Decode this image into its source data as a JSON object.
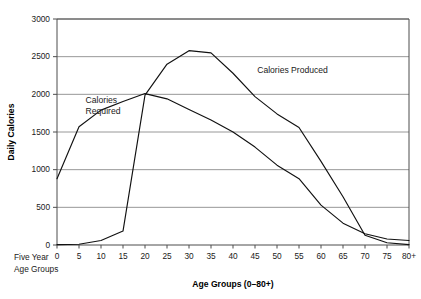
{
  "chart_data": {
    "type": "line",
    "title": "",
    "xlabel": "Age Groups (0–80+)",
    "ylabel": "Daily Calories",
    "x": [
      0,
      5,
      10,
      15,
      20,
      25,
      30,
      35,
      40,
      45,
      50,
      55,
      60,
      65,
      70,
      75,
      80
    ],
    "categories": [
      "0",
      "5",
      "10",
      "15",
      "20",
      "25",
      "30",
      "35",
      "40",
      "45",
      "50",
      "55",
      "60",
      "65",
      "70",
      "75",
      "80+"
    ],
    "xlim": [
      0,
      80
    ],
    "ylim": [
      0,
      3000
    ],
    "yticks": [
      0,
      500,
      1000,
      1500,
      2000,
      2500,
      3000
    ],
    "ytick_labels": [
      "0",
      "500",
      "1000",
      "1500",
      "2000",
      "2500",
      "3000"
    ],
    "grid": "horizontal",
    "legend": "inline-annotations",
    "series": [
      {
        "name": "Calories Required",
        "values": [
          880,
          1570,
          1790,
          1905,
          2010,
          1940,
          1800,
          1660,
          1500,
          1300,
          1060,
          880,
          530,
          290,
          150,
          80,
          60
        ]
      },
      {
        "name": "Calories Produced",
        "values": [
          5,
          10,
          60,
          185,
          1990,
          2400,
          2580,
          2550,
          2280,
          1970,
          1740,
          1560,
          1110,
          640,
          130,
          30,
          5
        ]
      }
    ],
    "annotations": [
      {
        "text": "Calories\nRequired",
        "lines": [
          "Calories",
          "Required"
        ],
        "x": 6.5,
        "y": 1880
      },
      {
        "text": "Calories Produced",
        "lines": [
          "Calories Produced"
        ],
        "x": 45.5,
        "y": 2280
      }
    ],
    "corner_note": {
      "lines": [
        "Five Year",
        "Age Groups"
      ]
    }
  },
  "layout": {
    "plot_left": 57,
    "plot_right": 409,
    "plot_top": 19,
    "plot_bottom": 245
  },
  "colors": {
    "line": "#111111",
    "grid": "#8c8c8c",
    "axis": "#4d4d4d",
    "text": "#1a1a1a",
    "background": "#ffffff"
  }
}
